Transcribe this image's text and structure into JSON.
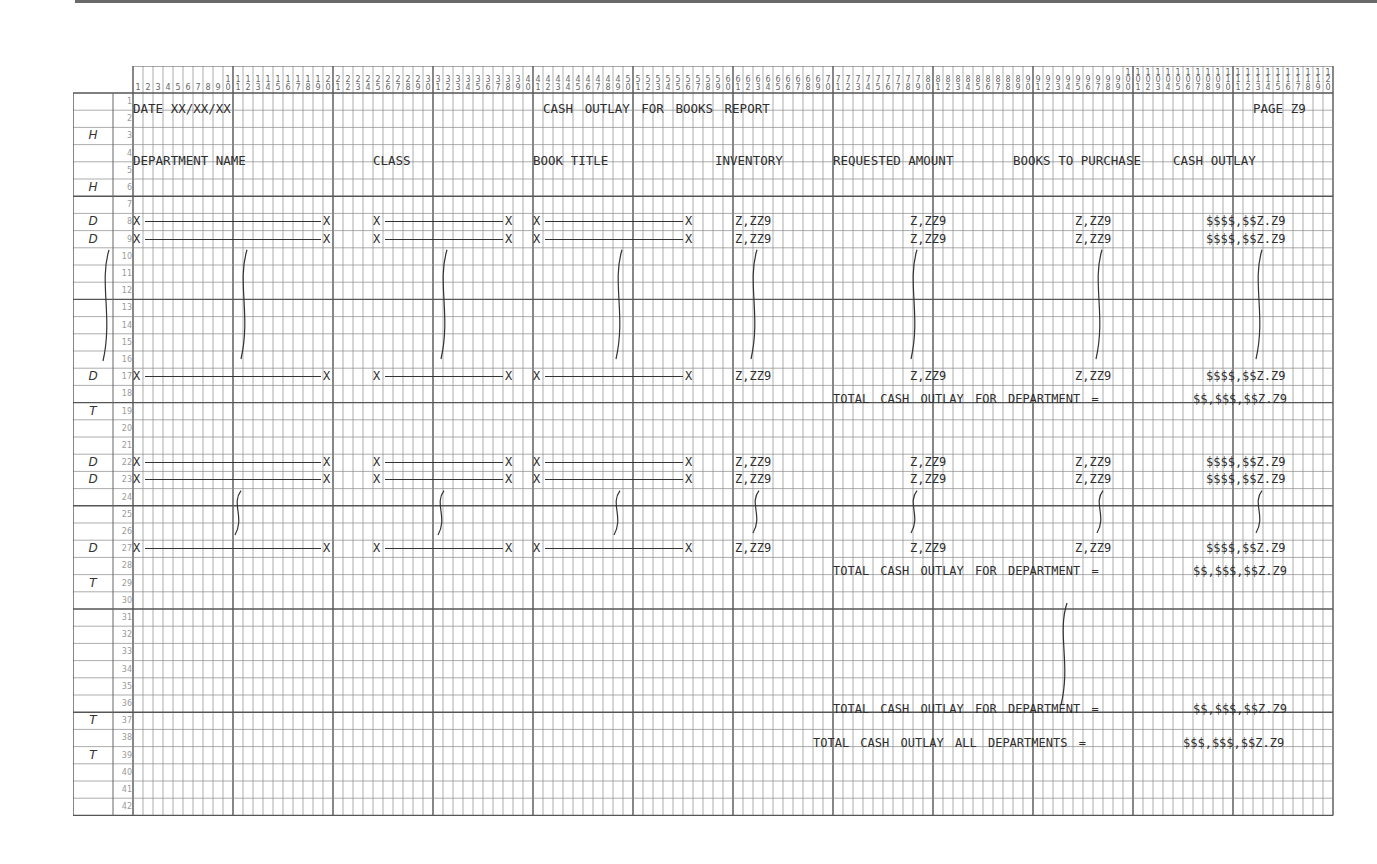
{
  "document": {
    "type": "print-layout-spacing-chart",
    "columns": 120,
    "rows": 42
  },
  "row_types": {
    "3": "H",
    "6": "H",
    "8": "D",
    "9": "D",
    "17": "D",
    "19": "T",
    "22": "D",
    "23": "D",
    "27": "D",
    "29": "T",
    "37": "T",
    "39": "T"
  },
  "header": {
    "date_label": "DATE XX/XX/XX",
    "report_title": "CASH OUTLAY FOR BOOKS REPORT",
    "page_label": "PAGE Z9"
  },
  "column_headings": {
    "department_name": "DEPARTMENT NAME",
    "class": "CLASS",
    "book_title": "BOOK TITLE",
    "inventory": "INVENTORY",
    "requested_amount": "REQUESTED AMOUNT",
    "books_to_purchase": "BOOKS TO PURCHASE",
    "cash_outlay": "CASH OUTLAY"
  },
  "detail_line": {
    "field_start": "X",
    "field_end": "X",
    "inventory": "Z,ZZ9",
    "requested_amount": "Z,ZZ9",
    "books_to_purchase": "Z,ZZ9",
    "cash_outlay": "$$$$,$$Z.Z9"
  },
  "totals": {
    "department_total_label": "TOTAL CASH OUTLAY FOR DEPARTMENT =",
    "department_total_value": "$$,$$$,$$Z.Z9",
    "all_departments_label": "TOTAL CASH OUTLAY ALL DEPARTMENTS =",
    "all_departments_value": "$$$,$$$,$$Z.Z9"
  }
}
